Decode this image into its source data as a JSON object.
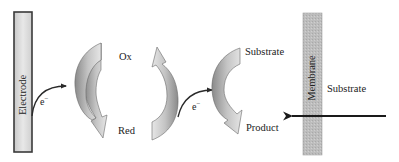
{
  "diagram": {
    "title": "",
    "electrode": {
      "label": "Electrode"
    },
    "membrane": {
      "label": "Membrane"
    },
    "mediator_cycle": {
      "oxidized_label": "Ox",
      "reduced_label": "Red"
    },
    "enzyme_cycle": {
      "substrate_label": "Substrate",
      "product_label": "Product"
    },
    "outside_substrate_label": "Substrate",
    "electron_transfer": [
      {
        "from": "Electrode",
        "to": "Ox",
        "label_base": "e",
        "label_sup": "−"
      },
      {
        "from": "Red",
        "to": "Substrate",
        "label_base": "e",
        "label_sup": "−"
      }
    ],
    "colors": {
      "electrode_fill": "#dcdcdc",
      "electrode_border": "#3a3a3a",
      "membrane_fill": "#bdbdbd",
      "curved_arrow_light": "#d8d8d8",
      "curved_arrow_dark": "#7a7a7a",
      "line": "#2a2a2a",
      "text": "#222222"
    }
  }
}
